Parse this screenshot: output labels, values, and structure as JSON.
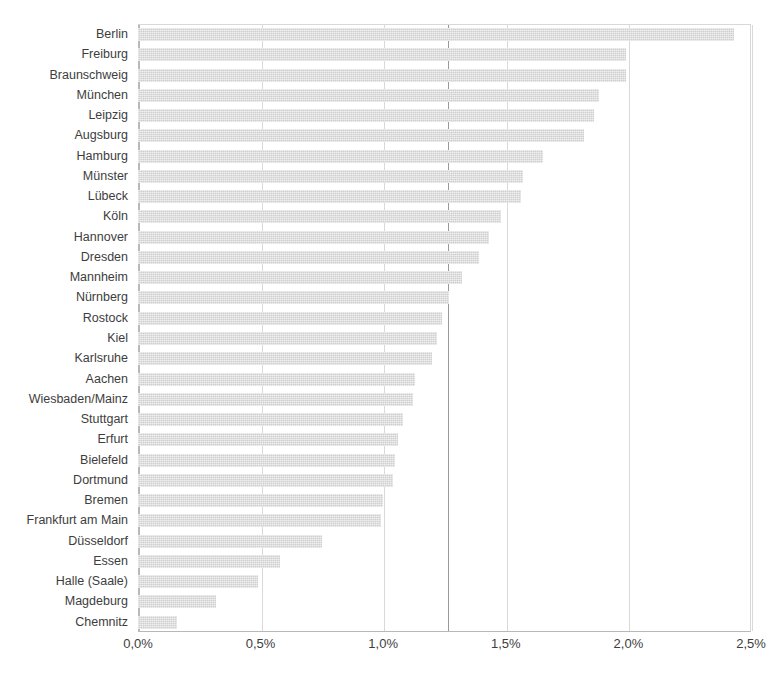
{
  "chart_data": {
    "type": "bar",
    "orientation": "horizontal",
    "title": "",
    "subtitle": "",
    "xlabel": "",
    "ylabel": "",
    "xlim": [
      0,
      2.5
    ],
    "xtick_labels": [
      "0,0%",
      "0,5%",
      "1,0%",
      "1,5%",
      "2,0%",
      "2,5%"
    ],
    "xtick_values": [
      0,
      0.5,
      1.0,
      1.5,
      2.0,
      2.5
    ],
    "grid": "vertical",
    "legend": "none",
    "value_suffix": "%",
    "reference_line": {
      "value": 1.26,
      "label": ""
    },
    "categories": [
      "Berlin",
      "Freiburg",
      "Braunschweig",
      "München",
      "Leipzig",
      "Augsburg",
      "Hamburg",
      "Münster",
      "Lübeck",
      "Köln",
      "Hannover",
      "Dresden",
      "Mannheim",
      "Nürnberg",
      "Rostock",
      "Kiel",
      "Karlsruhe",
      "Aachen",
      "Wiesbaden/Mainz",
      "Stuttgart",
      "Erfurt",
      "Bielefeld",
      "Dortmund",
      "Bremen",
      "Frankfurt am Main",
      "Düsseldorf",
      "Essen",
      "Halle (Saale)",
      "Magdeburg",
      "Chemnitz"
    ],
    "values": [
      2.43,
      1.99,
      1.99,
      1.88,
      1.86,
      1.82,
      1.65,
      1.57,
      1.56,
      1.48,
      1.43,
      1.39,
      1.32,
      1.27,
      1.24,
      1.22,
      1.2,
      1.13,
      1.12,
      1.08,
      1.06,
      1.05,
      1.04,
      1.0,
      0.99,
      0.75,
      0.58,
      0.49,
      0.32,
      0.16
    ]
  },
  "style": {
    "bar_color": "#cfcfcf",
    "grid_color": "#d9d9d9",
    "reference_line_color": "#9a9a9a",
    "text_color": "#3d3d3d"
  }
}
